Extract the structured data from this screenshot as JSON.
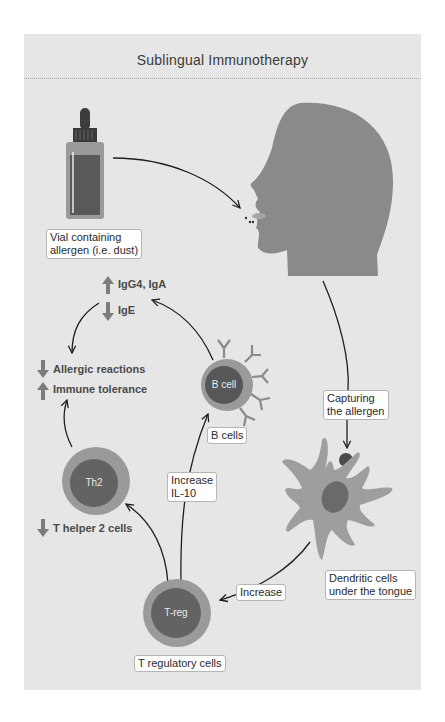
{
  "title": "Sublingual Immunotherapy",
  "labels": {
    "vial": [
      "Vial containing",
      "allergen (i.e. dust)"
    ],
    "capturing": [
      "Capturing",
      "the allergen"
    ],
    "dendritic": [
      "Dendritic cells",
      "under the tongue"
    ],
    "increase": "Increase",
    "increase_il10": [
      "Increase",
      "IL-10"
    ],
    "b_cells": "B cells",
    "t_regulatory": "T regulatory cells"
  },
  "cells": {
    "b_cell": "B cell",
    "th2": "Th2",
    "treg": "T-reg"
  },
  "effects": {
    "antibodies": [
      {
        "direction": "up",
        "text": "IgG4, IgA"
      },
      {
        "direction": "down",
        "text": "IgE"
      }
    ],
    "outcomes": [
      {
        "direction": "down",
        "text": "Allergic reactions"
      },
      {
        "direction": "up",
        "text": "Immune tolerance"
      }
    ],
    "th2": {
      "direction": "down",
      "text": "T helper 2 cells"
    }
  },
  "colors": {
    "panel": "#e6e6e6",
    "head": "#8a8a8a",
    "cell_outer": "#9a9a9a",
    "cell_inner": "#5e5e5e",
    "arrow": "#1e1e1e",
    "effect_arrow": "#7c7c7c"
  }
}
